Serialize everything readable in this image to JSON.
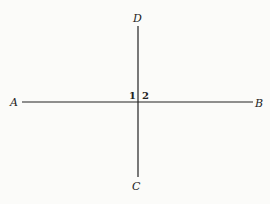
{
  "diagram": {
    "points": {
      "A": "A",
      "B": "B",
      "C": "C",
      "D": "D"
    },
    "angles": {
      "one": "1",
      "two": "2"
    },
    "lines": [
      {
        "name": "AB",
        "from": "A",
        "to": "B"
      },
      {
        "name": "CD",
        "from": "C",
        "to": "D"
      }
    ]
  }
}
